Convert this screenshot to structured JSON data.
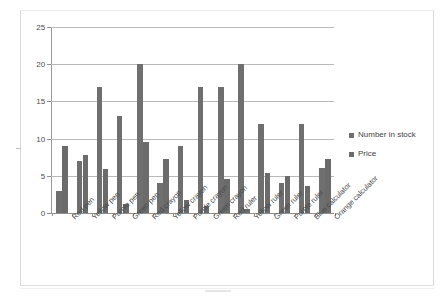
{
  "chart_data": {
    "type": "bar",
    "title": "",
    "subtitle": "",
    "xlabel": "",
    "ylabel": "",
    "ylim": [
      0,
      25
    ],
    "yticks": [
      0,
      5,
      10,
      15,
      20,
      25
    ],
    "grid": true,
    "legend_position": "right",
    "categories": [
      "Red pen",
      "Yellow pen",
      "Purple pen",
      "Green pen",
      "Red crayon",
      "Yellow crayon",
      "Purple crayon",
      "Green crayon",
      "Red ruler",
      "Yellow ruler",
      "Green ruler",
      "Purple ruler",
      "Blue calculator",
      "Orange calculator"
    ],
    "series": [
      {
        "name": "Number in stock",
        "color": "#6f6f6f",
        "values": [
          3,
          7,
          17,
          13,
          20,
          4,
          9,
          17,
          17,
          20,
          12,
          4,
          12,
          6
        ]
      },
      {
        "name": "Price",
        "color": "#6b6b6b",
        "values": [
          9,
          7.8,
          5.9,
          1.2,
          9.6,
          7.3,
          1.8,
          0.9,
          4.6,
          0.6,
          5.4,
          5,
          3.6,
          7.2
        ]
      }
    ]
  },
  "legend": {
    "items": [
      {
        "label": "Number in stock",
        "color": "#6f6f6f"
      },
      {
        "label": "Price",
        "color": "#6b6b6b"
      }
    ]
  },
  "axis": {
    "y_tick_labels": [
      "25",
      "20",
      "15",
      "10",
      "5",
      "0"
    ]
  }
}
